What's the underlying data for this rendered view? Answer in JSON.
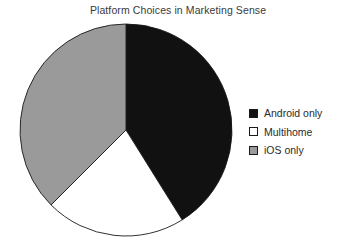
{
  "chart_data": {
    "type": "pie",
    "title": "Platform Choices in Marketing Sense",
    "categories": [
      "Android only",
      "Multihome",
      "iOS only"
    ],
    "values": [
      41,
      21,
      38
    ],
    "units": "percent",
    "start_angle_deg": 0,
    "direction": "clockwise",
    "slice_boundaries_deg": [
      0,
      148,
      225,
      360
    ],
    "colors": [
      "#111111",
      "#ffffff",
      "#9a9a9a"
    ],
    "edge_color": "#1a1a1a",
    "legend_position": "right",
    "grid": false,
    "xlabel": "",
    "ylabel": ""
  },
  "legend": {
    "items": [
      {
        "label": "Android only",
        "color": "#111111"
      },
      {
        "label": "Multihome",
        "color": "#ffffff"
      },
      {
        "label": "iOS only",
        "color": "#9a9a9a"
      }
    ]
  }
}
